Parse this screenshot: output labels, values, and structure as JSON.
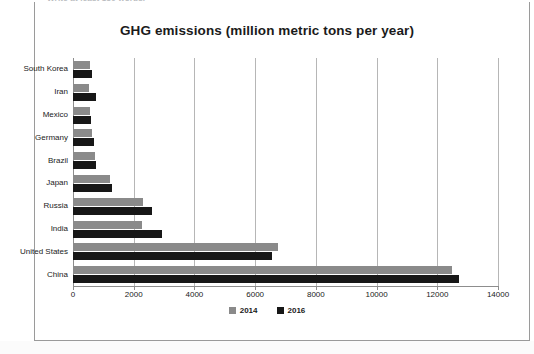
{
  "page": {
    "cut_off_text": "Write at least 150 words.",
    "background": "#ffffff",
    "frame_color": "#9a9a9a"
  },
  "chart_data": {
    "type": "bar",
    "orientation": "horizontal",
    "title": "GHG emissions (million metric tons per year)",
    "xlabel": "",
    "ylabel": "",
    "xlim": [
      0,
      14000
    ],
    "xticks": [
      0,
      2000,
      4000,
      6000,
      8000,
      10000,
      12000,
      14000
    ],
    "xtick_labels": [
      "0",
      "2000",
      "4000",
      "6000",
      "8000",
      "10000",
      "12000",
      "14000"
    ],
    "grid": true,
    "grid_axis": "x",
    "legend_position": "bottom-center",
    "categories": [
      "South Korea",
      "Iran",
      "Mexico",
      "Germany",
      "Brazil",
      "Japan",
      "Russia",
      "India",
      "United States",
      "China"
    ],
    "series": [
      {
        "name": "2014",
        "color": "#8a8a8a",
        "values": [
          570,
          530,
          560,
          630,
          730,
          1220,
          2300,
          2270,
          6750,
          12480
        ]
      },
      {
        "name": "2016",
        "color": "#171717",
        "values": [
          640,
          760,
          590,
          700,
          760,
          1290,
          2600,
          2930,
          6550,
          12700
        ]
      }
    ]
  }
}
